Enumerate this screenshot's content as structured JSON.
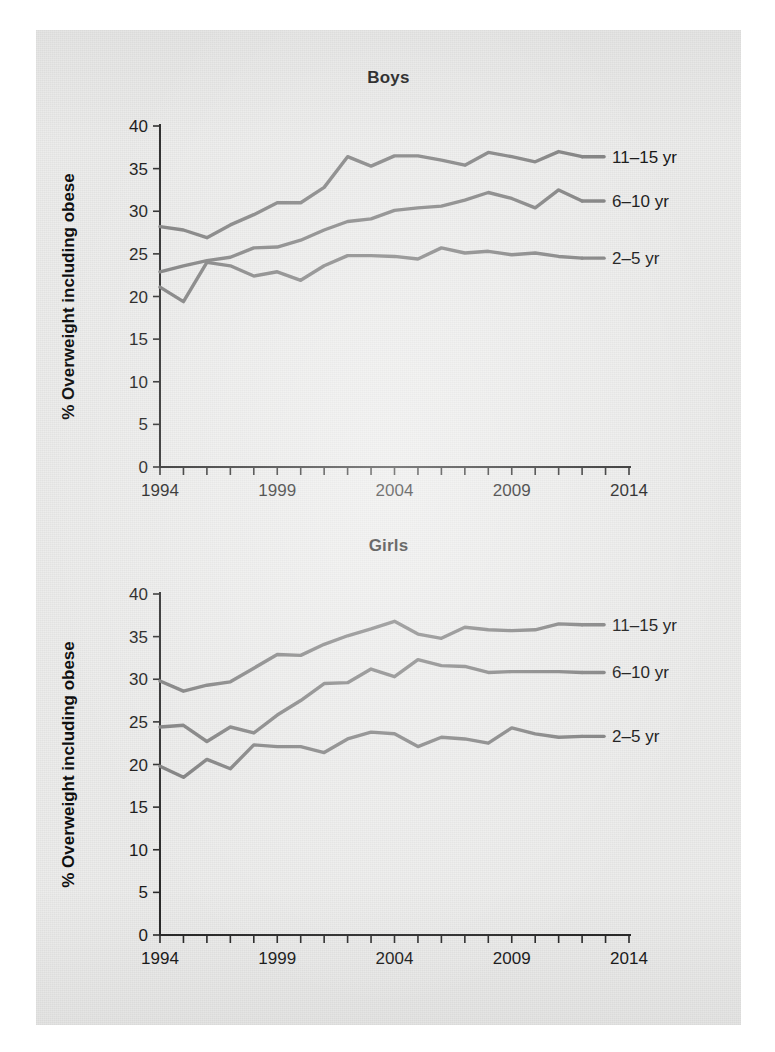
{
  "page": {
    "background_color": "#ececeb",
    "line_color": "#7d7d7d",
    "axis_color": "#2a2a2a"
  },
  "charts": [
    {
      "id": "boys",
      "title": "Boys",
      "ylabel": "% Overweight including obese"
    },
    {
      "id": "girls",
      "title": "Girls",
      "ylabel": "% Overweight including obese"
    }
  ],
  "axis": {
    "y_ticks": [
      "0",
      "5",
      "10",
      "15",
      "20",
      "25",
      "30",
      "35",
      "40"
    ],
    "x_ticks_labeled": [
      "1994",
      "1999",
      "2004",
      "2009",
      "2014"
    ]
  },
  "series_labels": {
    "older": "11–15 yr",
    "middle": "6–10 yr",
    "younger": "2–5 yr"
  },
  "chart_data": [
    {
      "type": "line",
      "title": "Boys",
      "xlabel": "",
      "ylabel": "% Overweight including obese",
      "xlim": [
        1994,
        2014
      ],
      "ylim": [
        0,
        40
      ],
      "grid": false,
      "legend_position": "inline-right",
      "x": [
        1994,
        1995,
        1996,
        1997,
        1998,
        1999,
        2000,
        2001,
        2002,
        2003,
        2004,
        2005,
        2006,
        2007,
        2008,
        2009,
        2010,
        2011,
        2012
      ],
      "series": [
        {
          "name": "11–15 yr",
          "values": [
            28.2,
            27.8,
            26.9,
            28.4,
            29.6,
            31.0,
            31.0,
            32.8,
            36.4,
            35.3,
            36.5,
            36.5,
            36.0,
            35.4,
            36.9,
            36.4,
            35.8,
            37.0,
            36.4
          ]
        },
        {
          "name": "6–10 yr",
          "values": [
            22.9,
            23.6,
            24.2,
            24.6,
            25.7,
            25.8,
            26.6,
            27.8,
            28.8,
            29.1,
            30.1,
            30.4,
            30.6,
            31.3,
            32.2,
            31.5,
            30.4,
            32.5,
            31.2
          ]
        },
        {
          "name": "2–5 yr",
          "values": [
            21.1,
            19.4,
            24.0,
            23.6,
            22.4,
            22.9,
            21.9,
            23.6,
            24.8,
            24.8,
            24.7,
            24.4,
            25.7,
            25.1,
            25.3,
            24.9,
            25.1,
            24.7,
            24.5
          ]
        }
      ]
    },
    {
      "type": "line",
      "title": "Girls",
      "xlabel": "",
      "ylabel": "% Overweight including obese",
      "xlim": [
        1994,
        2014
      ],
      "ylim": [
        0,
        40
      ],
      "grid": false,
      "legend_position": "inline-right",
      "x": [
        1994,
        1995,
        1996,
        1997,
        1998,
        1999,
        2000,
        2001,
        2002,
        2003,
        2004,
        2005,
        2006,
        2007,
        2008,
        2009,
        2010,
        2011,
        2012
      ],
      "series": [
        {
          "name": "11–15 yr",
          "values": [
            29.8,
            28.6,
            29.3,
            29.7,
            31.3,
            32.9,
            32.8,
            34.1,
            35.1,
            35.9,
            36.8,
            35.3,
            34.8,
            36.1,
            35.8,
            35.7,
            35.8,
            36.5,
            36.4
          ]
        },
        {
          "name": "6–10 yr",
          "values": [
            24.4,
            24.6,
            22.7,
            24.4,
            23.7,
            25.8,
            27.5,
            29.5,
            29.6,
            31.2,
            30.3,
            32.3,
            31.6,
            31.5,
            30.8,
            30.9,
            30.9,
            30.9,
            30.8
          ]
        },
        {
          "name": "2–5 yr",
          "values": [
            19.8,
            18.5,
            20.6,
            19.5,
            22.3,
            22.1,
            22.1,
            21.4,
            23.0,
            23.8,
            23.6,
            22.1,
            23.2,
            23.0,
            22.5,
            24.3,
            23.6,
            23.2,
            23.3
          ]
        }
      ]
    }
  ]
}
